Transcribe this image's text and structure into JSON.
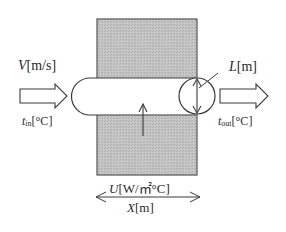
{
  "diagram": {
    "type": "heat-exchanger-pipe-schematic",
    "colors": {
      "block_fill": "#bdbdbd",
      "stroke": "#3a3a3a",
      "background": "#ffffff",
      "pipe_fill": "#ffffff"
    },
    "labels": {
      "velocity": {
        "symbol": "V",
        "unit": "[m/s]"
      },
      "inlet_temp": {
        "symbol": "t",
        "subscript": "in",
        "unit": "[°C]"
      },
      "diameter": {
        "symbol": "L",
        "unit": "[m]"
      },
      "outlet_temp": {
        "symbol": "t",
        "subscript": "out",
        "unit": "[°C]"
      },
      "heat_transfer_coeff": {
        "symbol": "U",
        "unit": "[W/㎡°C]"
      },
      "length": {
        "symbol": "X",
        "unit": "[m]"
      }
    },
    "elements": [
      "inlet-flow-arrow",
      "pipe",
      "heat-block",
      "pipe-cross-section-circle",
      "heat-flux-arrow",
      "outlet-flow-arrow",
      "length-dimension-arrow"
    ]
  }
}
